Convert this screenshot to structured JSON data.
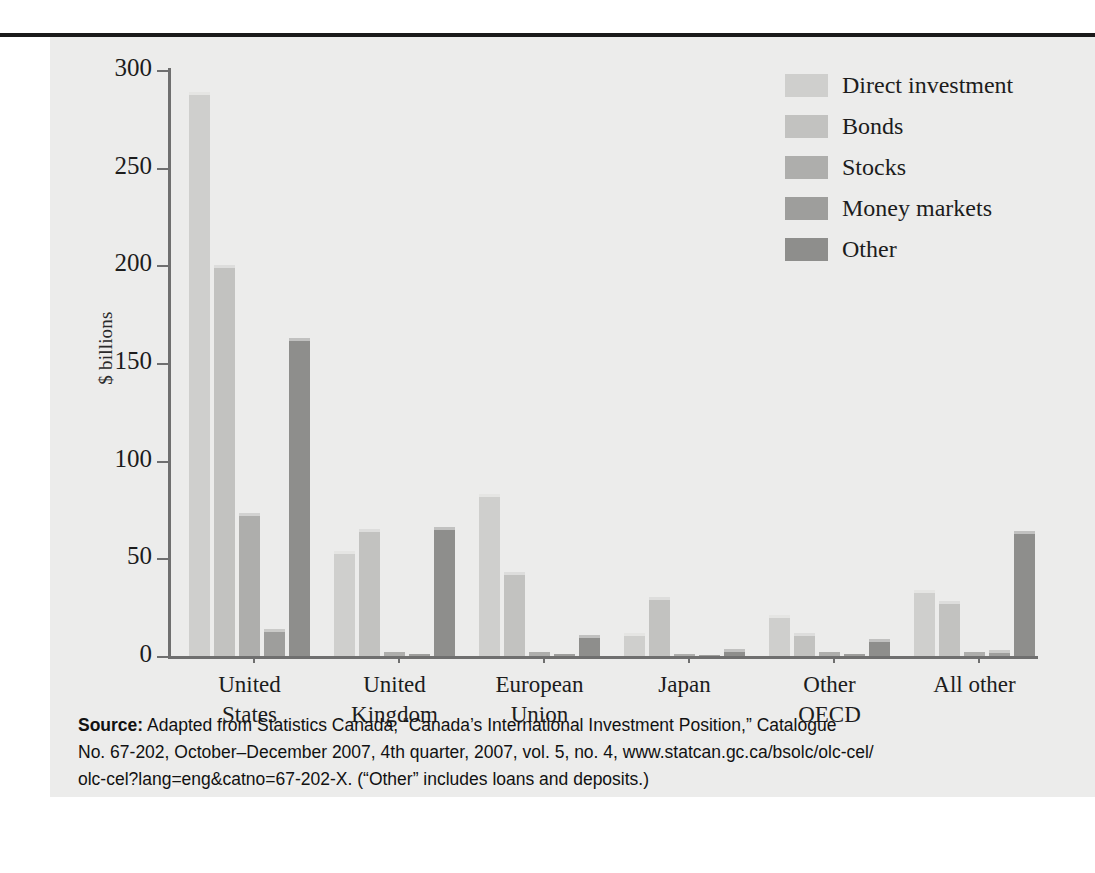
{
  "figure": {
    "ylabel": "$ billions",
    "y_ticks": [
      "300",
      "250",
      "200",
      "150",
      "100",
      "50",
      "0"
    ],
    "source_label": "Source:",
    "source_line1": " Adapted from Statistics Canada, “Canada’s International Investment Position,” Catalogue",
    "source_line2": "No. 67-202, October–December 2007, 4th quarter, 2007, vol. 5, no. 4, www.statcan.gc.ca/bsolc/olc-cel/",
    "source_line3": "olc-cel?lang=eng&catno=67-202-X. (“Other” includes loans and deposits.)"
  },
  "chart_data": {
    "type": "bar",
    "title": "",
    "xlabel": "",
    "ylabel": "$ billions",
    "ylim": [
      0,
      300
    ],
    "yticks": [
      0,
      50,
      100,
      150,
      200,
      250,
      300
    ],
    "grid": false,
    "legend_position": "top-right",
    "categories": [
      "United States",
      "United Kingdom",
      "European Union",
      "Japan",
      "Other OECD",
      "All other"
    ],
    "category_lines": [
      [
        "United",
        "States"
      ],
      [
        "United",
        "Kingdom"
      ],
      [
        "European",
        "Union"
      ],
      [
        "Japan",
        ""
      ],
      [
        "Other",
        "OECD"
      ],
      [
        "All other",
        ""
      ]
    ],
    "series": [
      {
        "name": "Direct investment",
        "color": "#cfcfcd",
        "values": [
          289,
          54,
          83,
          12,
          21,
          34
        ]
      },
      {
        "name": "Bonds",
        "color": "#c2c2c0",
        "values": [
          200,
          65,
          43,
          30,
          12,
          28
        ]
      },
      {
        "name": "Stocks",
        "color": "#aeaeac",
        "values": [
          73,
          2,
          2,
          1,
          2,
          2
        ]
      },
      {
        "name": "Money markets",
        "color": "#9e9e9c",
        "values": [
          14,
          1,
          1,
          0.5,
          1,
          3
        ]
      },
      {
        "name": "Other",
        "color": "#8e8e8c",
        "values": [
          163,
          66,
          11,
          3.5,
          8.5,
          64
        ]
      }
    ]
  }
}
